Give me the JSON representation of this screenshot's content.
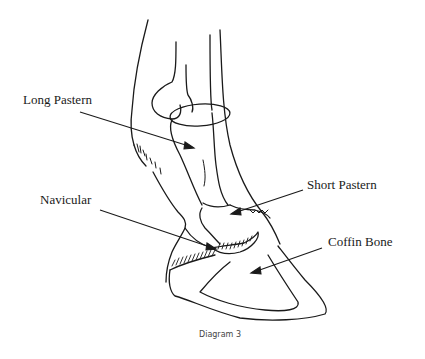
{
  "diagram": {
    "caption": "Diagram 3",
    "labels": {
      "long_pastern": "Long Pastern",
      "navicular": "Navicular",
      "short_pastern": "Short Pastern",
      "coffin_bone": "Coffin Bone"
    },
    "colors": {
      "ink": "#1a1a1a",
      "background": "#ffffff",
      "caption": "#444444"
    }
  }
}
